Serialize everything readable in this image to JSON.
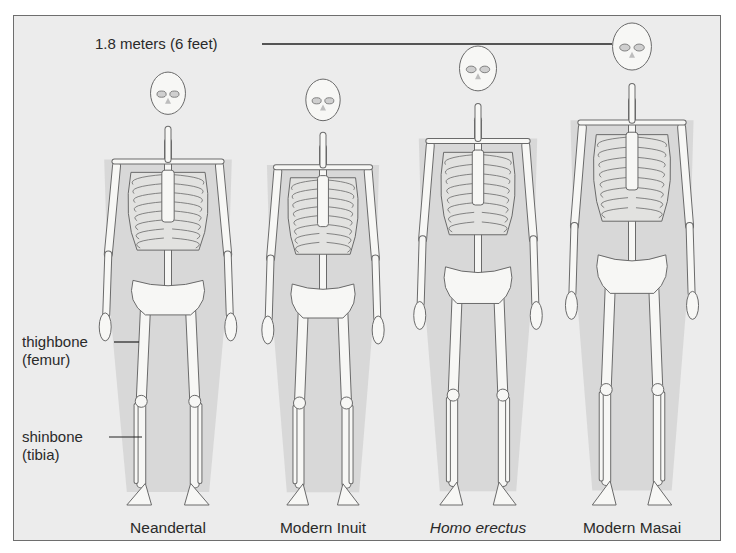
{
  "figure": {
    "height_marker": "1.8 meters (6 feet)",
    "annotations": {
      "femur_line1": "thighbone",
      "femur_line2": "(femur)",
      "tibia_line1": "shinbone",
      "tibia_line2": "(tibia)"
    },
    "skeletons": [
      {
        "name": "Neandertal",
        "italic": false,
        "cx": 168,
        "head_top": 73,
        "scale": 0.92,
        "width": 1.12
      },
      {
        "name": "Modern Inuit",
        "italic": false,
        "cx": 323,
        "head_top": 80,
        "scale": 0.89,
        "width": 1.0
      },
      {
        "name": "Homo erectus",
        "italic": true,
        "cx": 478,
        "head_top": 47,
        "scale": 1.0,
        "width": 0.98
      },
      {
        "name": "Modern Masai",
        "italic": false,
        "cx": 632,
        "head_top": 24,
        "scale": 1.05,
        "width": 0.97
      }
    ],
    "colors": {
      "background": "#ececec",
      "bone": "#f7f7f5",
      "outline": "#6a6a6a",
      "body_shadow": "#c9c9c9",
      "frame": "#6e6e6e"
    }
  }
}
